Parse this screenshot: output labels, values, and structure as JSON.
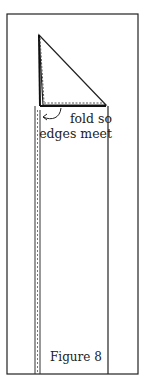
{
  "figure": {
    "caption": "Figure 8",
    "annotation": {
      "line_1": "fold so",
      "line_2": "edges meet"
    },
    "colors": {
      "stroke": "#222222",
      "background": "#ffffff",
      "dash": "#777777"
    },
    "icons": {
      "fold_arrow": "curved-arrow-icon"
    }
  }
}
